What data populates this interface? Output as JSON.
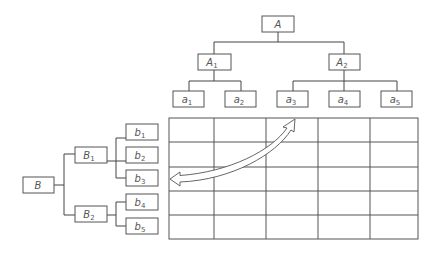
{
  "diagram": {
    "type": "two-hierarchy matrix",
    "top_tree": {
      "root": {
        "label": "A",
        "sub": ""
      },
      "level1": [
        {
          "label": "A",
          "sub": "1",
          "children": [
            {
              "label": "a",
              "sub": "1"
            },
            {
              "label": "a",
              "sub": "2"
            }
          ]
        },
        {
          "label": "A",
          "sub": "2",
          "children": [
            {
              "label": "a",
              "sub": "3"
            },
            {
              "label": "a",
              "sub": "4"
            },
            {
              "label": "a",
              "sub": "5"
            }
          ]
        }
      ]
    },
    "left_tree": {
      "root": {
        "label": "B",
        "sub": ""
      },
      "level1": [
        {
          "label": "B",
          "sub": "1",
          "children": [
            {
              "label": "b",
              "sub": "1"
            },
            {
              "label": "b",
              "sub": "2"
            },
            {
              "label": "b",
              "sub": "3"
            }
          ]
        },
        {
          "label": "B",
          "sub": "2",
          "children": [
            {
              "label": "b",
              "sub": "4"
            },
            {
              "label": "b",
              "sub": "5"
            }
          ]
        }
      ]
    },
    "matrix": {
      "rows": 5,
      "columns": 5
    },
    "arrow": {
      "type": "double-headed curved",
      "from": "a3 column",
      "to": "b3 row"
    },
    "colors": {
      "stroke": "#555555",
      "background": "#ffffff"
    }
  }
}
